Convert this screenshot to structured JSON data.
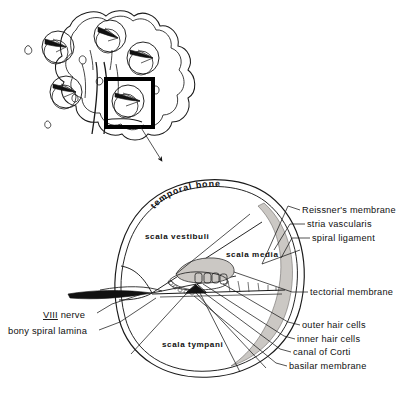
{
  "figure": {
    "background_color": "#ffffff",
    "ink_color": "#1a1a1a",
    "shade_color": "#c9c6c2",
    "width": 419,
    "height": 401
  },
  "inset": {
    "name": "cochlea-spiral-inset",
    "description": "cochlear spiral turns with highlight box",
    "highlight_box": {
      "x": 106,
      "y": 79,
      "width": 47,
      "height": 48,
      "stroke_color": "#000000",
      "stroke_width": 4
    },
    "turn_count": 5,
    "arrow": {
      "from_x": 140,
      "from_y": 126,
      "to_x": 164,
      "to_y": 163
    }
  },
  "interior_labels": [
    {
      "id": "temporal-bone",
      "text": "temporal bone",
      "x": 172,
      "y": 190,
      "curved": true
    },
    {
      "id": "scala-vestibuli",
      "text": "scala  vestibuli",
      "x": 145,
      "y": 236,
      "curved": false
    },
    {
      "id": "scala-media",
      "text": "scala  media",
      "x": 226,
      "y": 254,
      "curved": false
    },
    {
      "id": "scala-tympani",
      "text": "scala  tympani",
      "x": 162,
      "y": 344,
      "curved": false
    }
  ],
  "right_labels": [
    {
      "id": "reissners-membrane",
      "text": "Reissner's  membrane",
      "text_x": 302,
      "text_y": 213,
      "leader": "M 300 210 L 288 206 L 262 264"
    },
    {
      "id": "stria-vascularis",
      "text": "stria vascularis",
      "text_x": 307,
      "text_y": 227,
      "leader": "M 305 224 L 290 224 L 274 248"
    },
    {
      "id": "spiral-ligament",
      "text": "spiral ligament",
      "text_x": 312,
      "text_y": 241,
      "leader": "M 310 238 L 292 238 L 280 256"
    },
    {
      "id": "tectorial-membrane",
      "text": "tectorial membrane",
      "text_x": 310,
      "text_y": 295,
      "leader": "M 308 292 L 292 292 L 229 276"
    },
    {
      "id": "outer-hair-cells",
      "text": "outer  hair  cells",
      "text_x": 302,
      "text_y": 328,
      "leader": "M 300 325 L 288 322 L 222 287"
    },
    {
      "id": "inner-hair-cells",
      "text": "inner hair cells",
      "text_x": 297,
      "text_y": 342,
      "leader": "M 295 339 L 284 336 L 214 289"
    },
    {
      "id": "canal-of-corti",
      "text": "canal of Corti",
      "text_x": 293,
      "text_y": 355,
      "leader": "M 291 352 L 280 349 L 210 292"
    },
    {
      "id": "basilar-membrane",
      "text": "basilar  membrane",
      "text_x": 289,
      "text_y": 369,
      "leader": "M 287 366 L 276 363 L 206 294"
    }
  ],
  "left_labels": [
    {
      "id": "viii-nerve",
      "text": "VIII nerve",
      "underlined_prefix": "VIII",
      "text_x": 43,
      "text_y": 318,
      "leader": "M 97 315 L 112 306 L 140 296"
    },
    {
      "id": "bony-spiral-lamina",
      "text": "bony spiral lamina",
      "text_x": 8,
      "text_y": 334,
      "leader": "M 99 331 L 118 324 L 150 300"
    }
  ],
  "structures": {
    "viii_nerve_wedge": "black tapered wedge entering at modiolus",
    "tectorial_membrane": "shaded lobe over hair cells",
    "spiral_ligament_band": "shaded crescent along outer wall",
    "outer_hair_cell_count": 3,
    "inner_hair_cell_count": 1
  }
}
